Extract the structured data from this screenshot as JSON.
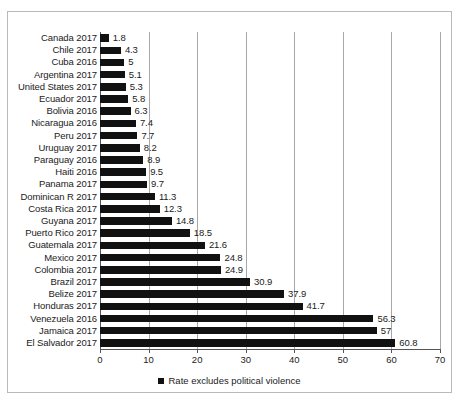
{
  "chart_data": {
    "type": "bar",
    "orientation": "horizontal",
    "title": "",
    "xlabel": "",
    "ylabel": "",
    "xlim": [
      0,
      70
    ],
    "xticks": [
      0,
      10,
      20,
      30,
      40,
      50,
      60,
      70
    ],
    "xtick_labels": [
      "0",
      "10",
      "20",
      "30",
      "40",
      "50",
      "60",
      "70"
    ],
    "grid": true,
    "grid_axis": "x",
    "legend_position": "bottom-center",
    "legend_entries": [
      "Rate excludes political violence"
    ],
    "bar_color": "#111111",
    "categories": [
      "Canada 2017",
      "Chile 2017",
      "Cuba 2016",
      "Argentina 2017",
      "United States 2017",
      "Ecuador 2017",
      "Bolivia 2016",
      "Nicaragua 2016",
      "Peru 2017",
      "Uruguay 2017",
      "Paraguay 2016",
      "Haiti 2016",
      "Panama 2017",
      "Dominican R 2017",
      "Costa Rica 2017",
      "Guyana 2017",
      "Puerto Rico 2017",
      "Guatemala 2017",
      "Mexico 2017",
      "Colombia 2017",
      "Brazil 2017",
      "Belize 2017",
      "Honduras 2017",
      "Venezuela 2016",
      "Jamaica 2017",
      "El Salvador 2017"
    ],
    "values": [
      1.8,
      4.3,
      5,
      5.1,
      5.3,
      5.8,
      6.3,
      7.4,
      7.7,
      8.2,
      8.9,
      9.5,
      9.7,
      11.3,
      12.3,
      14.8,
      18.5,
      21.6,
      24.8,
      24.9,
      30.9,
      37.9,
      41.7,
      56.3,
      57,
      60.8
    ],
    "value_labels": [
      "1.8",
      "4.3",
      "5",
      "5.1",
      "5.3",
      "5.8",
      "6.3",
      "7.4",
      "7.7",
      "8.2",
      "8.9",
      "9.5",
      "9.7",
      "11.3",
      "12.3",
      "14.8",
      "18.5",
      "21.6",
      "24.8",
      "24.9",
      "30.9",
      "37.9",
      "41.7",
      "56.3",
      "57",
      "60.8"
    ]
  },
  "legend": {
    "marker": "filled-square",
    "label": "Rate excludes political violence"
  }
}
